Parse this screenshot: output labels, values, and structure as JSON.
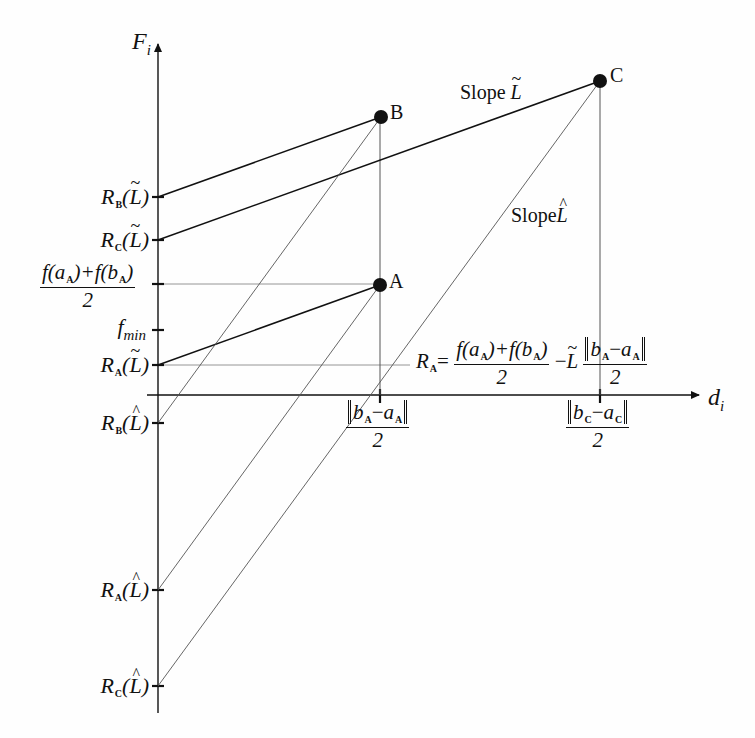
{
  "figure": {
    "y_axis_label": "F",
    "y_axis_sub": "i",
    "x_axis_label": "d",
    "x_axis_sub": "i"
  },
  "points": [
    {
      "name": "A",
      "label": "A"
    },
    {
      "name": "B",
      "label": "B"
    },
    {
      "name": "C",
      "label": "C"
    }
  ],
  "slope_labels": {
    "tilde": {
      "word": "Slope",
      "symbol": "L"
    },
    "hat": {
      "word": "Slope",
      "symbol": "L"
    }
  },
  "y_ticks": [
    {
      "id": "RB_tilde",
      "R": "R",
      "sub": "B",
      "arg": "L",
      "mark": "tilde"
    },
    {
      "id": "RC_tilde",
      "R": "R",
      "sub": "C",
      "arg": "L",
      "mark": "tilde"
    },
    {
      "id": "f_avg",
      "num_left": "f(a",
      "num_left_sub": "A",
      "num_mid": ")+f(b",
      "num_mid_sub": "A",
      "num_right": ")",
      "den": "2"
    },
    {
      "id": "f_min",
      "f": "f",
      "sub": "min"
    },
    {
      "id": "RA_tilde",
      "R": "R",
      "sub": "A",
      "arg": "L",
      "mark": "tilde"
    },
    {
      "id": "RB_hat",
      "R": "R",
      "sub": "B",
      "arg": "L",
      "mark": "hat"
    },
    {
      "id": "RA_hat",
      "R": "R",
      "sub": "A",
      "arg": "L",
      "mark": "hat"
    },
    {
      "id": "RC_hat",
      "R": "R",
      "sub": "C",
      "arg": "L",
      "mark": "hat"
    }
  ],
  "x_ticks": [
    {
      "id": "dA",
      "b": "b",
      "b_sub": "A",
      "minus": "−",
      "a": "a",
      "a_sub": "A",
      "den": "2"
    },
    {
      "id": "dC",
      "b": "b",
      "b_sub": "C",
      "minus": "−",
      "a": "a",
      "a_sub": "C",
      "den": "2"
    }
  ],
  "equation": {
    "lhs": "R",
    "lhs_sub": "A",
    "eq": "=",
    "num_left": "f(a",
    "num_left_sub": "A",
    "num_mid": ")+f(b",
    "num_mid_sub": "A",
    "num_right": ")",
    "den": "2",
    "minus": "−",
    "L": "L",
    "norm_b": "b",
    "norm_b_sub": "A",
    "norm_minus": "−",
    "norm_a": "a",
    "norm_a_sub": "A",
    "norm_den": "2"
  },
  "colors": {
    "ink": "#111111",
    "thin": "#555555",
    "guide": "#888888"
  }
}
